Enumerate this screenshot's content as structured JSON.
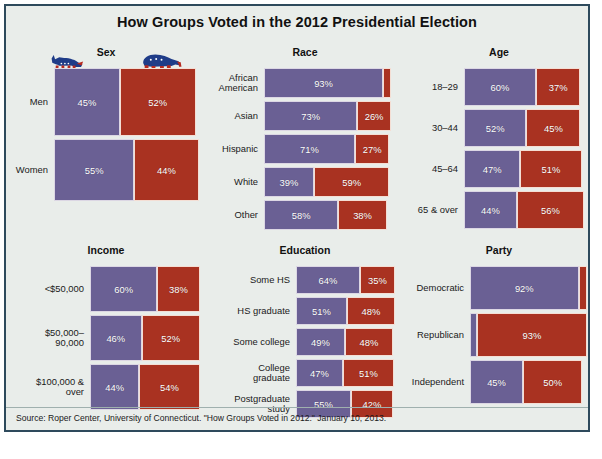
{
  "title": "How Groups Voted in the 2012 Presidential Election",
  "source": "Source: Roper Center, University of Connecticut. \"How Groups Voted in 2012.\" January 10, 2013.",
  "icons": {
    "democrat": "donkey-icon",
    "republican": "elephant-icon"
  },
  "colors": {
    "democrat": "#6a6094",
    "republican": "#a93221",
    "background": "#e9edea",
    "border": "#2e4a5c",
    "bar_outline": "#f3e6e0"
  },
  "chart_data": {
    "type": "bar",
    "title": "How Groups Voted in the 2012 Presidential Election",
    "note": "Marimekko-style paired bars: width encodes percent of vote, row height encodes share of electorate.",
    "series": [
      {
        "name": "Democrat (Obama)",
        "color": "#6a6094"
      },
      {
        "name": "Republican (Romney)",
        "color": "#a93221"
      }
    ],
    "panels": [
      {
        "id": "sex",
        "title": "Sex",
        "rows": [
          {
            "label": "Men",
            "dem": 45,
            "rep": 52,
            "weight": 47
          },
          {
            "label": "Women",
            "dem": 55,
            "rep": 44,
            "weight": 53
          }
        ]
      },
      {
        "id": "race",
        "title": "Race",
        "rows": [
          {
            "label": "African\nAmerican",
            "dem": 93,
            "rep": 6,
            "weight": 13
          },
          {
            "label": "Asian",
            "dem": 73,
            "rep": 26,
            "weight": 3
          },
          {
            "label": "Hispanic",
            "dem": 71,
            "rep": 27,
            "weight": 10
          },
          {
            "label": "White",
            "dem": 39,
            "rep": 59,
            "weight": 72
          },
          {
            "label": "Other",
            "dem": 58,
            "rep": 38,
            "weight": 2
          }
        ]
      },
      {
        "id": "age",
        "title": "Age",
        "rows": [
          {
            "label": "18–29",
            "dem": 60,
            "rep": 37,
            "weight": 19
          },
          {
            "label": "30–44",
            "dem": 52,
            "rep": 45,
            "weight": 27
          },
          {
            "label": "45–64",
            "dem": 47,
            "rep": 51,
            "weight": 38
          },
          {
            "label": "65 & over",
            "dem": 44,
            "rep": 56,
            "weight": 16
          }
        ]
      },
      {
        "id": "income",
        "title": "Income",
        "rows": [
          {
            "label": "<$50,000",
            "dem": 60,
            "rep": 38,
            "weight": 41
          },
          {
            "label": "$50,000–\n90,000",
            "dem": 46,
            "rep": 52,
            "weight": 31
          },
          {
            "label": "$100,000 &\nover",
            "dem": 44,
            "rep": 54,
            "weight": 28
          }
        ]
      },
      {
        "id": "education",
        "title": "Education",
        "rows": [
          {
            "label": "Some HS",
            "dem": 64,
            "rep": 35,
            "weight": 3
          },
          {
            "label": "HS graduate",
            "dem": 51,
            "rep": 48,
            "weight": 21
          },
          {
            "label": "Some college",
            "dem": 49,
            "rep": 48,
            "weight": 29
          },
          {
            "label": "College\ngraduate",
            "dem": 47,
            "rep": 51,
            "weight": 29
          },
          {
            "label": "Postgraduate\nstudy",
            "dem": 55,
            "rep": 42,
            "weight": 18
          }
        ]
      },
      {
        "id": "party",
        "title": "Party",
        "rows": [
          {
            "label": "Democratic",
            "dem": 92,
            "rep": 7,
            "weight": 38
          },
          {
            "label": "Republican",
            "dem": 6,
            "rep": 93,
            "weight": 32
          },
          {
            "label": "Independent",
            "dem": 45,
            "rep": 50,
            "weight": 29
          }
        ]
      }
    ]
  }
}
